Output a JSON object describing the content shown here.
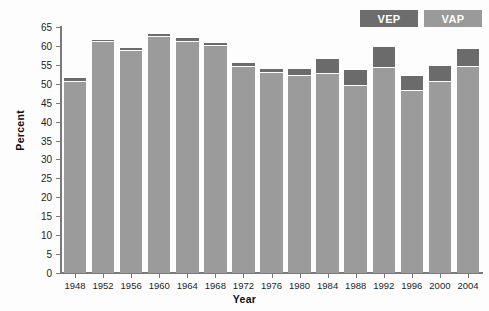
{
  "chart_data": {
    "type": "bar",
    "title": "",
    "subtitle": "",
    "xlabel": "Year",
    "ylabel": "Percent",
    "categories": [
      "1948",
      "1952",
      "1956",
      "1960",
      "1964",
      "1968",
      "1972",
      "1976",
      "1980",
      "1984",
      "1988",
      "1992",
      "1996",
      "2000",
      "2004"
    ],
    "ylim": [
      0,
      65
    ],
    "yticks": [
      0,
      5,
      10,
      15,
      20,
      25,
      30,
      35,
      40,
      45,
      50,
      55,
      60,
      65
    ],
    "grid": false,
    "stacked": true,
    "legend_position": "top-right",
    "series": [
      {
        "name": "VAP",
        "color": "#9b9b9b",
        "values": [
          50.4,
          61.0,
          58.6,
          62.3,
          61.1,
          60.1,
          54.5,
          52.8,
          52.1,
          52.6,
          49.4,
          54.3,
          48.1,
          50.6,
          54.4
        ]
      },
      {
        "name": "VEP",
        "color": "#6b6b6b",
        "values": [
          51.5,
          61.7,
          59.5,
          63.1,
          62.1,
          60.9,
          55.6,
          54.0,
          54.0,
          56.5,
          53.6,
          59.8,
          52.0,
          54.8,
          59.3
        ]
      }
    ]
  },
  "legend": {
    "items": [
      {
        "label": "VEP",
        "color": "#6d6d6d"
      },
      {
        "label": "VAP",
        "color": "#9a9a9a"
      }
    ]
  },
  "axes": {
    "y_title": "Percent",
    "x_title": "Year",
    "y_tick_labels": [
      "65",
      "60",
      "55",
      "50",
      "45",
      "40",
      "35",
      "30",
      "25",
      "20",
      "15",
      "10",
      "5",
      "0"
    ],
    "x_tick_labels": [
      "1948",
      "1952",
      "1956",
      "1960",
      "1964",
      "1968",
      "1972",
      "1976",
      "1980",
      "1984",
      "1988",
      "1992",
      "1996",
      "2000",
      "2004"
    ]
  }
}
